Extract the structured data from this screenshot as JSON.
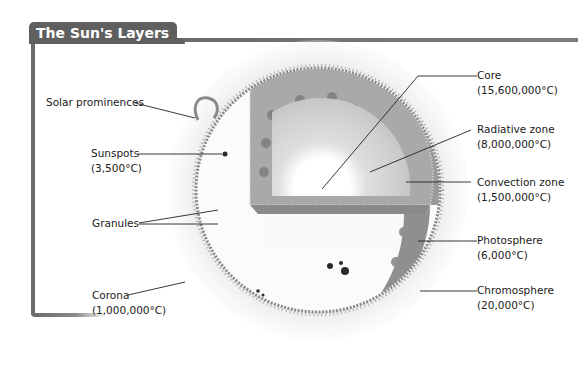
{
  "title": "The Sun's Layers",
  "labels_left": [
    {
      "id": "solar-prominences",
      "name": "Solar prominences",
      "temp": ""
    },
    {
      "id": "sunspots",
      "name": "Sunspots",
      "temp": "(3,500°C)"
    },
    {
      "id": "granules",
      "name": "Granules",
      "temp": ""
    },
    {
      "id": "corona",
      "name": "Corona",
      "temp": "(1,000,000°C)"
    }
  ],
  "labels_right": [
    {
      "id": "core",
      "name": "Core",
      "temp": "(15,600,000°C)"
    },
    {
      "id": "radiative-zone",
      "name": "Radiative zone",
      "temp": "(8,000,000°C)"
    },
    {
      "id": "convection-zone",
      "name": "Convection zone",
      "temp": "(1,500,000°C)"
    },
    {
      "id": "photosphere",
      "name": "Photosphere",
      "temp": "(6,000°C)"
    },
    {
      "id": "chromosphere",
      "name": "Chromosphere",
      "temp": "(20,000°C)"
    }
  ],
  "colors": {
    "frame": "#6a6a6a",
    "title_bg": "#5f5f5f",
    "title_text": "#ffffff",
    "label_text": "#1a1a1a"
  }
}
